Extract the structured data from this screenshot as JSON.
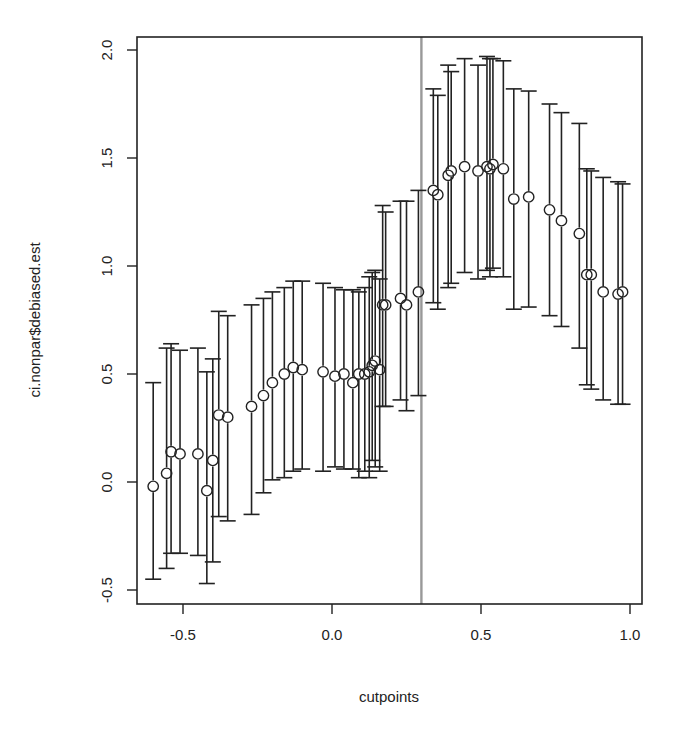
{
  "chart_data": {
    "type": "scatter",
    "subtype": "point estimates with confidence interval error bars",
    "title": "",
    "xlabel": "cutpoints",
    "ylabel": "ci.nonpar$debiased.est",
    "xlim": [
      -0.65,
      1.04
    ],
    "ylim": [
      -0.55,
      2.05
    ],
    "x_ticks": [
      "-0.5",
      "0.0",
      "0.5",
      "1.0"
    ],
    "y_ticks": [
      "-0.5",
      "0.0",
      "0.5",
      "1.0",
      "1.5",
      "2.0"
    ],
    "grid": false,
    "legend": null,
    "reference_line": {
      "orientation": "vertical",
      "x": 0.3,
      "color": "#999999"
    },
    "points": [
      {
        "x": -0.6,
        "est": -0.02,
        "lower": -0.45,
        "upper": 0.46
      },
      {
        "x": -0.555,
        "est": 0.04,
        "lower": -0.4,
        "upper": 0.62
      },
      {
        "x": -0.54,
        "est": 0.14,
        "lower": -0.33,
        "upper": 0.64
      },
      {
        "x": -0.51,
        "est": 0.13,
        "lower": -0.33,
        "upper": 0.61
      },
      {
        "x": -0.45,
        "est": 0.13,
        "lower": -0.34,
        "upper": 0.62
      },
      {
        "x": -0.42,
        "est": -0.04,
        "lower": -0.47,
        "upper": 0.51
      },
      {
        "x": -0.4,
        "est": 0.1,
        "lower": -0.37,
        "upper": 0.57
      },
      {
        "x": -0.38,
        "est": 0.31,
        "lower": -0.16,
        "upper": 0.79
      },
      {
        "x": -0.35,
        "est": 0.3,
        "lower": -0.18,
        "upper": 0.77
      },
      {
        "x": -0.27,
        "est": 0.35,
        "lower": -0.15,
        "upper": 0.82
      },
      {
        "x": -0.23,
        "est": 0.4,
        "lower": -0.05,
        "upper": 0.85
      },
      {
        "x": -0.2,
        "est": 0.46,
        "lower": 0.01,
        "upper": 0.88
      },
      {
        "x": -0.16,
        "est": 0.5,
        "lower": 0.02,
        "upper": 0.9
      },
      {
        "x": -0.13,
        "est": 0.53,
        "lower": 0.05,
        "upper": 0.93
      },
      {
        "x": -0.1,
        "est": 0.52,
        "lower": 0.06,
        "upper": 0.93
      },
      {
        "x": -0.03,
        "est": 0.51,
        "lower": 0.05,
        "upper": 0.92
      },
      {
        "x": 0.01,
        "est": 0.49,
        "lower": 0.07,
        "upper": 0.9
      },
      {
        "x": 0.04,
        "est": 0.5,
        "lower": 0.06,
        "upper": 0.89
      },
      {
        "x": 0.07,
        "est": 0.46,
        "lower": 0.06,
        "upper": 0.89
      },
      {
        "x": 0.09,
        "est": 0.5,
        "lower": 0.02,
        "upper": 0.88
      },
      {
        "x": 0.11,
        "est": 0.5,
        "lower": 0.05,
        "upper": 0.9
      },
      {
        "x": 0.125,
        "est": 0.51,
        "lower": 0.02,
        "upper": 0.95
      },
      {
        "x": 0.135,
        "est": 0.54,
        "lower": 0.1,
        "upper": 0.97
      },
      {
        "x": 0.145,
        "est": 0.56,
        "lower": 0.07,
        "upper": 0.98
      },
      {
        "x": 0.16,
        "est": 0.52,
        "lower": 0.05,
        "upper": 0.94
      },
      {
        "x": 0.17,
        "est": 0.82,
        "lower": 0.35,
        "upper": 1.28
      },
      {
        "x": 0.18,
        "est": 0.82,
        "lower": 0.35,
        "upper": 1.25
      },
      {
        "x": 0.23,
        "est": 0.85,
        "lower": 0.38,
        "upper": 1.3
      },
      {
        "x": 0.25,
        "est": 0.82,
        "lower": 0.33,
        "upper": 1.3
      },
      {
        "x": 0.29,
        "est": 0.88,
        "lower": 0.4,
        "upper": 1.35
      },
      {
        "x": 0.34,
        "est": 1.35,
        "lower": 0.83,
        "upper": 1.82
      },
      {
        "x": 0.355,
        "est": 1.33,
        "lower": 0.8,
        "upper": 1.79
      },
      {
        "x": 0.39,
        "est": 1.42,
        "lower": 0.9,
        "upper": 1.93
      },
      {
        "x": 0.4,
        "est": 1.44,
        "lower": 0.92,
        "upper": 1.9
      },
      {
        "x": 0.445,
        "est": 1.46,
        "lower": 0.97,
        "upper": 1.96
      },
      {
        "x": 0.49,
        "est": 1.44,
        "lower": 0.94,
        "upper": 1.93
      },
      {
        "x": 0.52,
        "est": 1.46,
        "lower": 0.98,
        "upper": 1.97
      },
      {
        "x": 0.53,
        "est": 1.45,
        "lower": 0.95,
        "upper": 1.96
      },
      {
        "x": 0.54,
        "est": 1.47,
        "lower": 0.99,
        "upper": 1.96
      },
      {
        "x": 0.575,
        "est": 1.45,
        "lower": 0.95,
        "upper": 1.95
      },
      {
        "x": 0.61,
        "est": 1.31,
        "lower": 0.8,
        "upper": 1.82
      },
      {
        "x": 0.66,
        "est": 1.32,
        "lower": 0.81,
        "upper": 1.81
      },
      {
        "x": 0.73,
        "est": 1.26,
        "lower": 0.77,
        "upper": 1.75
      },
      {
        "x": 0.77,
        "est": 1.21,
        "lower": 0.72,
        "upper": 1.71
      },
      {
        "x": 0.83,
        "est": 1.15,
        "lower": 0.62,
        "upper": 1.66
      },
      {
        "x": 0.855,
        "est": 0.96,
        "lower": 0.45,
        "upper": 1.45
      },
      {
        "x": 0.87,
        "est": 0.96,
        "lower": 0.43,
        "upper": 1.44
      },
      {
        "x": 0.91,
        "est": 0.88,
        "lower": 0.38,
        "upper": 1.41
      },
      {
        "x": 0.96,
        "est": 0.87,
        "lower": 0.36,
        "upper": 1.39
      },
      {
        "x": 0.975,
        "est": 0.88,
        "lower": 0.36,
        "upper": 1.38
      }
    ]
  },
  "colors": {
    "axis": "#222222",
    "points": "#222222",
    "reference_line": "#999999",
    "background": "#ffffff"
  }
}
